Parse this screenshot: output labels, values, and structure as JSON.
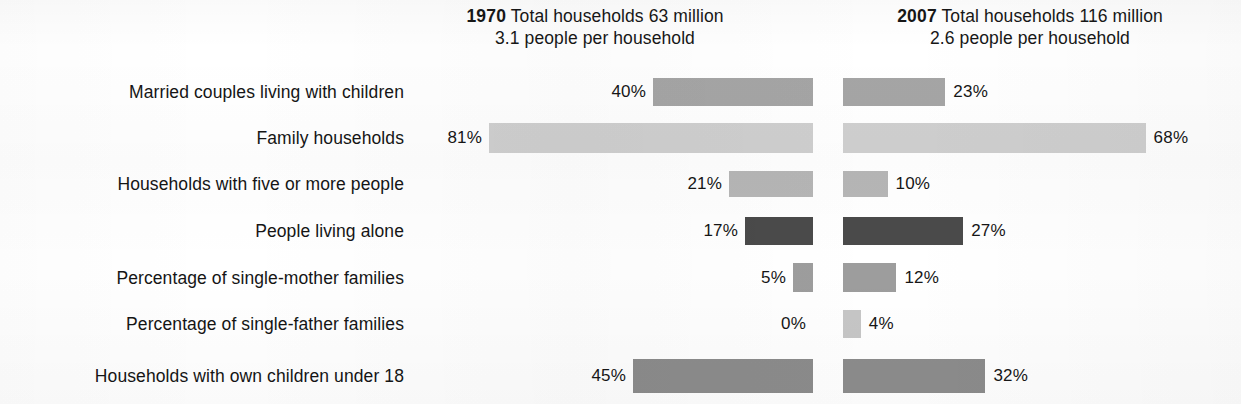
{
  "headers": {
    "left": {
      "year": "1970",
      "line1": " Total households 63 million",
      "line2": "3.1 people per household"
    },
    "right": {
      "year": "2007",
      "line1": " Total households 116 million",
      "line2": "2.6 people per household"
    }
  },
  "chart_data": {
    "type": "bar",
    "orientation": "horizontal-diverging",
    "xlabel": "",
    "ylabel": "",
    "xlim": [
      0,
      100
    ],
    "grid": false,
    "legend_position": "none",
    "categories": [
      "Married couples living with children",
      "Family households",
      "Households with five or more people",
      "People living alone",
      "Percentage of single-mother families",
      "Percentage of single-father families",
      "Households with own children under 18"
    ],
    "series": [
      {
        "name": "1970",
        "values": [
          40,
          81,
          21,
          17,
          5,
          0,
          45
        ],
        "labels": [
          "40%",
          "81%",
          "21%",
          "17%",
          "5%",
          "0%",
          "45%"
        ]
      },
      {
        "name": "2007",
        "values": [
          23,
          68,
          10,
          27,
          12,
          4,
          32
        ],
        "labels": [
          "23%",
          "68%",
          "10%",
          "27%",
          "12%",
          "4%",
          "32%"
        ]
      }
    ],
    "annotations": {
      "left_total_households_millions": 63,
      "left_people_per_household": 3.1,
      "right_total_households_millions": 116,
      "right_people_per_household": 2.6
    },
    "bar_colors": {
      "row_0": "#a5a5a5",
      "row_1": "#cfcfcf",
      "row_2": "#b6b6b6",
      "row_3": "#4a4a4a",
      "row_4": "#9d9d9d",
      "row_5": "#c6c6c6",
      "row_6": "#8c8c8c"
    }
  },
  "rows": [
    {
      "label": "Married couples living with children",
      "left": {
        "pct": "40%",
        "value": 40
      },
      "right": {
        "pct": "23%",
        "value": 23
      },
      "color": "#a5a5a5",
      "bar_height": "28px"
    },
    {
      "label": "Family households",
      "left": {
        "pct": "81%",
        "value": 81
      },
      "right": {
        "pct": "68%",
        "value": 68
      },
      "color": "#cfcfcf",
      "bar_height": "30px"
    },
    {
      "label": "Households with five or more people",
      "left": {
        "pct": "21%",
        "value": 21
      },
      "right": {
        "pct": "10%",
        "value": 10
      },
      "color": "#b6b6b6",
      "bar_height": "26px"
    },
    {
      "label": "People living alone",
      "left": {
        "pct": "17%",
        "value": 17
      },
      "right": {
        "pct": "27%",
        "value": 27
      },
      "color": "#4a4a4a",
      "bar_height": "28px"
    },
    {
      "label": "Percentage of single-mother families",
      "left": {
        "pct": "5%",
        "value": 5
      },
      "right": {
        "pct": "12%",
        "value": 12
      },
      "color": "#9d9d9d",
      "bar_height": "29px"
    },
    {
      "label": "Percentage of single-father families",
      "left": {
        "pct": "0%",
        "value": 0
      },
      "right": {
        "pct": "4%",
        "value": 4
      },
      "color": "#c6c6c6",
      "bar_height": "28px"
    },
    {
      "label": "Households with own children under 18",
      "left": {
        "pct": "45%",
        "value": 45
      },
      "right": {
        "pct": "32%",
        "value": 32
      },
      "color": "#8c8c8c",
      "bar_height": "34px"
    }
  ],
  "layout": {
    "row_tops": [
      68,
      114,
      160,
      207,
      254,
      300,
      352
    ],
    "px_per_percent_left": 4.0,
    "px_per_percent_right": 4.45
  }
}
